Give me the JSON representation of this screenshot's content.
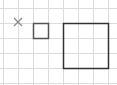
{
  "canvas": {
    "width": 117,
    "height": 85,
    "background": "#ffffff"
  },
  "grid": {
    "color": "#dcdcdc",
    "cell_size": 15,
    "x_lines": [
      3,
      18,
      33,
      48,
      63,
      78,
      93,
      108
    ],
    "y_lines": [
      8,
      23,
      38,
      53,
      68,
      83
    ],
    "x_start": 3,
    "x_end": 108,
    "y_start": 8,
    "y_end": 83
  },
  "shapes": {
    "cross_mark": {
      "cx": 18,
      "cy": 22,
      "size": 4,
      "color": "#8a8a8a"
    },
    "small_square": {
      "x": 33,
      "y": 23,
      "width": 15,
      "height": 15,
      "stroke": "#555555",
      "stroke_width": 1.5
    },
    "large_square": {
      "x": 63,
      "y": 23,
      "width": 45,
      "height": 45,
      "stroke": "#333333",
      "stroke_width": 1.5
    }
  }
}
